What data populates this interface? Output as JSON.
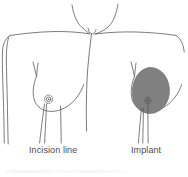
{
  "figure": {
    "background_color": "#ffffff",
    "line_color": "#5a5a5a",
    "implant_fill_color": "#808080",
    "implant_outline_color": "#6e6e6e",
    "label_color": "#4a4a4a"
  },
  "labels": {
    "incision_line": "Incision line",
    "implant": "Implant"
  },
  "parts": [
    {
      "id": "neck-notch",
      "name": "suprasternal-notch"
    },
    {
      "id": "left-shoulder",
      "name": "left-shoulder-outline"
    },
    {
      "id": "right-shoulder",
      "name": "right-shoulder-outline"
    },
    {
      "id": "left-arm",
      "name": "left-arm-outline"
    },
    {
      "id": "right-arm",
      "name": "right-arm-outline"
    },
    {
      "id": "left-breast",
      "name": "left-breast-outline"
    },
    {
      "id": "left-nipple",
      "name": "left-nipple-areola"
    },
    {
      "id": "right-breast",
      "name": "right-breast-outline"
    },
    {
      "id": "implant-shape",
      "name": "implant-shaded-oval"
    },
    {
      "id": "incision-leaders",
      "name": "incision-line-leaders"
    },
    {
      "id": "implant-leader",
      "name": "implant-leader-line"
    }
  ]
}
